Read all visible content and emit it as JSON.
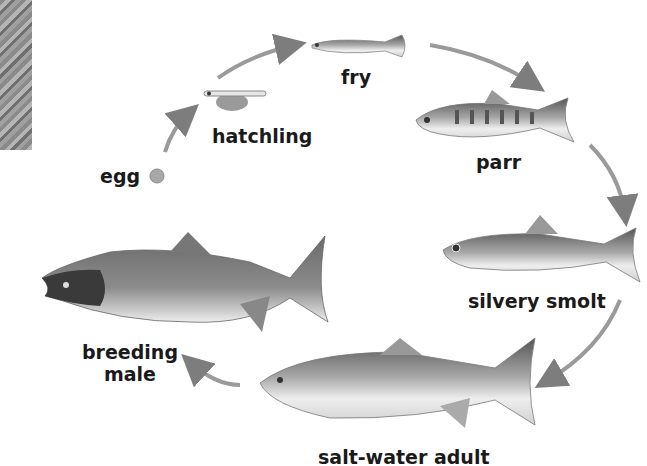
{
  "diagram": {
    "type": "life-cycle",
    "stages": [
      {
        "id": "egg",
        "label": "egg"
      },
      {
        "id": "hatchling",
        "label": "hatchling"
      },
      {
        "id": "fry",
        "label": "fry"
      },
      {
        "id": "parr",
        "label": "parr"
      },
      {
        "id": "smolt",
        "label": "silvery smolt"
      },
      {
        "id": "adult",
        "label": "salt-water adult"
      },
      {
        "id": "breeding",
        "label_line1": "breeding",
        "label_line2": "male"
      }
    ],
    "colors": {
      "arrow": "#8c8c8c",
      "fish_dark": "#4a4a4a",
      "fish_mid": "#8a8a8a",
      "fish_light": "#e8e8e8",
      "text": "#1a1a1a"
    }
  }
}
